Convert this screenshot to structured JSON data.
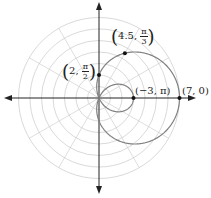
{
  "diagram": {
    "type": "polar-graph",
    "curve": "r = 2 + 5cos(theta)",
    "grid": {
      "rings": 7,
      "radial_spokes_deg": 30,
      "color": "#c8c8c8"
    },
    "axes_color": "#222222",
    "curve_color": "#808080",
    "points": [
      {
        "id": "p1",
        "r_label": "4.5",
        "theta_num": "π",
        "theta_den": "3",
        "r": 4.5,
        "theta_deg": 60
      },
      {
        "id": "p2",
        "r_label": "2",
        "theta_num": "π",
        "theta_den": "2",
        "r": 2,
        "theta_deg": 90
      },
      {
        "id": "p3",
        "label": "(−3, π)",
        "r": -3,
        "theta_deg": 180
      },
      {
        "id": "p4",
        "label": "(7, 0)",
        "r": 7,
        "theta_deg": 0
      }
    ]
  }
}
